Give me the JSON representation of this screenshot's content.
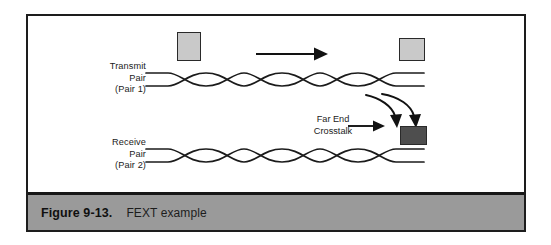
{
  "figure": {
    "caption_number": "Figure 9-13.",
    "caption_title": "FEXT example",
    "border_color": "#1d1d1d",
    "caption_bar_color": "#9a9a9a"
  },
  "diagram": {
    "type": "schematic",
    "labels": {
      "transmit": {
        "line1": "Transmit",
        "line2": "Pair",
        "line3": "(Pair 1)"
      },
      "receive": {
        "line1": "Receive",
        "line2": "Pair",
        "line3": "(Pair 2)"
      },
      "crosstalk": {
        "line1": "Far End",
        "line2": "Crosstalk"
      }
    },
    "elements": {
      "transmit_cable": "twisted-pair-cable",
      "receive_cable": "twisted-pair-cable",
      "signal_arrow": "right-arrow",
      "crosstalk_arrow": "right-arrow",
      "coupling_arrows": "curved-down-arrows"
    },
    "colors": {
      "connector_light": "#c9c9c9",
      "connector_dark": "#4e4e4e",
      "stroke": "#1b1b1b"
    }
  }
}
